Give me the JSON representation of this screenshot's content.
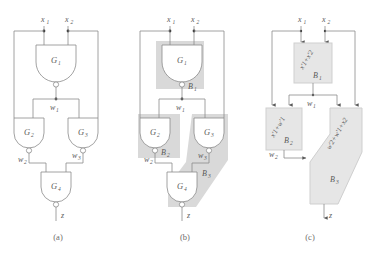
{
  "figure": {
    "background_color": "#ffffff",
    "line_color": "#8a8a8a",
    "text_color": "#5a5a5a",
    "shade_color": "#d9d9d9"
  },
  "captions": {
    "a": "(a)",
    "b": "(b)",
    "c": "(c)"
  },
  "signals": {
    "x1": "x",
    "x1_sub": "1",
    "x2": "x",
    "x2_sub": "2",
    "w1": "w",
    "w1_sub": "1",
    "w2": "w",
    "w2_sub": "2",
    "w3": "w",
    "w3_sub": "3",
    "z": "z"
  },
  "gates": {
    "g1": "G",
    "g1_sub": "1",
    "g2": "G",
    "g2_sub": "2",
    "g3": "G",
    "g3_sub": "3",
    "g4": "G",
    "g4_sub": "4",
    "type": "NAND"
  },
  "blocks": {
    "b1": "B",
    "b1_sub": "1",
    "b2": "B",
    "b2_sub": "2",
    "b3": "B",
    "b3_sub": "3"
  },
  "expressions": {
    "b1": "x'1+x'2",
    "b2": "x'1+w'1",
    "b3": "w'2+w'1+x2"
  },
  "panel_a": {
    "name": "gate-level-circuit",
    "description": "NAND gate circuit with gates G1 G2 G3 G4"
  },
  "panel_b": {
    "name": "circuit-with-block-shading",
    "description": "Same circuit overlaid with shaded blocks B1 B2 B3"
  },
  "panel_c": {
    "name": "block-diagram",
    "description": "Abstract block diagram with Boolean expressions"
  }
}
